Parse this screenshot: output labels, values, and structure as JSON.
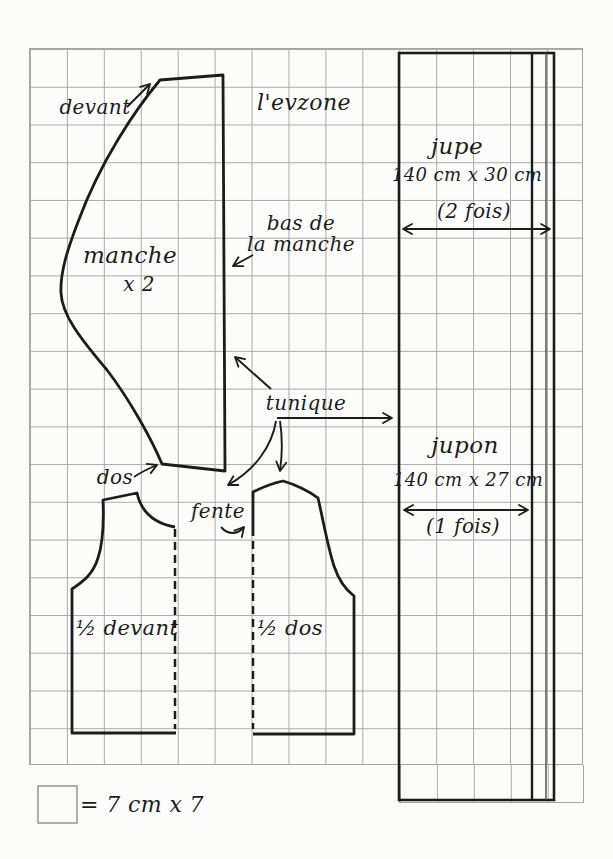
{
  "title": "l'evzone",
  "sleeve": {
    "label": "manche",
    "quantity": "x 2",
    "front_edge_label": "devant",
    "back_edge_label": "dos",
    "hem_label_line1": "bas de",
    "hem_label_line2": "la manche"
  },
  "tunic": {
    "label": "tunique",
    "slit_label": "fente",
    "half_front_label": "½ devant",
    "half_back_label": "½ dos"
  },
  "skirt": {
    "label": "jupe",
    "size": "140 cm x 30 cm",
    "count": "(2 fois)"
  },
  "underskirt": {
    "label": "jupon",
    "size": "140 cm x 27 cm",
    "count": "(1 fois)"
  },
  "legend": {
    "square_label": "= 7 cm x 7"
  },
  "colors": {
    "paper": "#fcfcfa",
    "grid_line": "#ababab",
    "ink": "#1c1c1c"
  }
}
